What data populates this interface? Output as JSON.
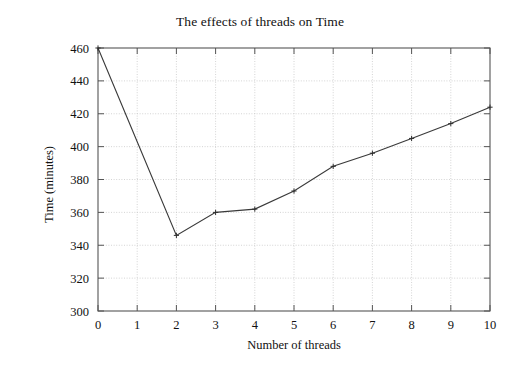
{
  "chart_data": {
    "type": "line",
    "title": "The effects of threads on Time",
    "xlabel": "Number of threads",
    "ylabel": "Time (minutes)",
    "x": [
      0,
      1,
      2,
      3,
      4,
      5,
      6,
      7,
      8,
      9,
      10
    ],
    "values": [
      460,
      403,
      346,
      360,
      362,
      373,
      388,
      396,
      405,
      414,
      424
    ],
    "markers_at_x": [
      0,
      2,
      3,
      4,
      5,
      6,
      7,
      8,
      9,
      10
    ],
    "xlim": [
      0,
      10
    ],
    "ylim": [
      300,
      460
    ],
    "xticks": [
      "0",
      "1",
      "2",
      "3",
      "4",
      "5",
      "6",
      "7",
      "8",
      "9",
      "10"
    ],
    "yticks": [
      "300",
      "320",
      "340",
      "360",
      "380",
      "400",
      "420",
      "440",
      "460"
    ],
    "xtick_values": [
      0,
      1,
      2,
      3,
      4,
      5,
      6,
      7,
      8,
      9,
      10
    ],
    "ytick_values": [
      300,
      320,
      340,
      360,
      380,
      400,
      420,
      440,
      460
    ],
    "grid": true,
    "grid_style": "dotted",
    "legend": false,
    "legend_position": "none",
    "series": [
      {
        "name": "Time",
        "values": [
          460,
          403,
          346,
          360,
          362,
          373,
          388,
          396,
          405,
          414,
          424
        ]
      }
    ],
    "colors": {
      "line": "#3a3a3a",
      "grid": "#c9c9c9",
      "axis": "#555555",
      "text": "#111111",
      "background": "#ffffff"
    }
  }
}
